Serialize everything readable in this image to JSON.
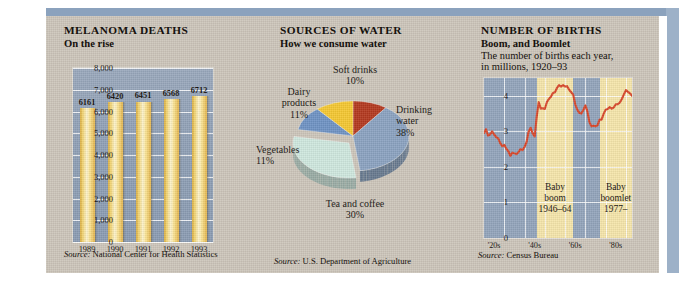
{
  "panels": [
    {
      "id": "melanoma",
      "title": "MELANOMA DEATHS",
      "subtitle": "On the rise",
      "source_prefix": "Source:",
      "source": "National Center for Health Statistics"
    },
    {
      "id": "water",
      "title": "SOURCES OF WATER",
      "subtitle": "How we consume water",
      "source_prefix": "Source:",
      "source": "U.S. Department of Agriculture"
    },
    {
      "id": "births",
      "title": "NUMBER OF BIRTHS",
      "subtitle": "Boom, and Boomlet",
      "desc_line1": "The number of births each year,",
      "desc_line2": "in millions, 1920–93",
      "source_prefix": "Source:",
      "source": "Census Bureau"
    }
  ],
  "chart_data": [
    {
      "type": "bar",
      "title": "MELANOMA DEATHS",
      "subtitle": "On the rise",
      "categories": [
        "1989",
        "1990",
        "1991",
        "1992",
        "1993"
      ],
      "values": [
        6161,
        6420,
        6451,
        6568,
        6712
      ],
      "data_labels": [
        "6161",
        "6420",
        "6451",
        "6568",
        "6712"
      ],
      "ylabel": "",
      "xlabel": "",
      "ylim": [
        0,
        8000
      ],
      "yticks": [
        0,
        1000,
        2000,
        3000,
        4000,
        5000,
        6000,
        7000,
        8000
      ],
      "ytick_labels": [
        "0",
        "1,000",
        "2,000",
        "3,000",
        "4,000",
        "5,000",
        "6,000",
        "7,000",
        "8,000"
      ],
      "grid": true,
      "legend": "none",
      "bar_color": "#f3d572",
      "plot_bg": "#93a4ba"
    },
    {
      "type": "pie",
      "title": "SOURCES OF WATER",
      "subtitle": "How we consume water",
      "labels": [
        "Drinking water",
        "Tea and coffee",
        "Vegetables",
        "Dairy products",
        "Soft drinks"
      ],
      "values": [
        38,
        30,
        11,
        11,
        10
      ],
      "label_texts": [
        {
          "name": "Drinking",
          "name2": "water",
          "pct": "38%"
        },
        {
          "name": "Tea and coffee",
          "pct": "30%"
        },
        {
          "name": "Vegetables",
          "pct": "11%"
        },
        {
          "name": "Dairy",
          "name2": "products",
          "pct": "11%"
        },
        {
          "name": "Soft drinks",
          "pct": "10%"
        }
      ],
      "colors": [
        "#8ba3c1",
        "#cfe8df",
        "#6f93c4",
        "#f5c832",
        "#b4391f"
      ],
      "legend": "labels-outside"
    },
    {
      "type": "line",
      "title": "NUMBER OF BIRTHS",
      "subtitle": "Boom, and Boomlet",
      "description": "The number of births each year, in millions, 1920–93",
      "xlabel": "",
      "ylabel": "",
      "ylim": [
        0,
        4.5
      ],
      "yticks": [
        0,
        1,
        2,
        3,
        4
      ],
      "ytick_labels": [
        "0",
        "1",
        "2",
        "3",
        "4"
      ],
      "xlim": [
        1920,
        1993
      ],
      "xtick_labels": [
        "'20s",
        "'40s",
        "'60s",
        "'80s"
      ],
      "xticks": [
        1925,
        1945,
        1965,
        1985
      ],
      "grid": true,
      "line_color": "#d9472a",
      "plot_bg": "#93a5bc",
      "band_color": "#f6e6ab",
      "annotations": [
        {
          "line1": "Baby",
          "line2": "boom",
          "line3": "1946–64",
          "start": 1946,
          "end": 1964
        },
        {
          "line1": "Baby",
          "line2": "boomlet",
          "line3": "1977–",
          "start": 1977,
          "end": 1993
        }
      ],
      "x": [
        1920,
        1921,
        1922,
        1923,
        1924,
        1925,
        1926,
        1927,
        1928,
        1929,
        1930,
        1931,
        1932,
        1933,
        1934,
        1935,
        1936,
        1937,
        1938,
        1939,
        1940,
        1941,
        1942,
        1943,
        1944,
        1945,
        1946,
        1947,
        1948,
        1949,
        1950,
        1951,
        1952,
        1953,
        1954,
        1955,
        1956,
        1957,
        1958,
        1959,
        1960,
        1961,
        1962,
        1963,
        1964,
        1965,
        1966,
        1967,
        1968,
        1969,
        1970,
        1971,
        1972,
        1973,
        1974,
        1975,
        1976,
        1977,
        1978,
        1979,
        1980,
        1981,
        1982,
        1983,
        1984,
        1985,
        1986,
        1987,
        1988,
        1989,
        1990,
        1991,
        1992,
        1993
      ],
      "values": [
        2.95,
        3.06,
        2.88,
        2.91,
        3.0,
        2.91,
        2.84,
        2.8,
        2.67,
        2.58,
        2.62,
        2.51,
        2.44,
        2.31,
        2.4,
        2.38,
        2.36,
        2.41,
        2.5,
        2.47,
        2.56,
        2.7,
        2.99,
        3.1,
        2.94,
        2.86,
        3.41,
        3.82,
        3.64,
        3.65,
        3.63,
        3.82,
        3.91,
        3.97,
        4.08,
        4.1,
        4.22,
        4.3,
        4.26,
        4.3,
        4.26,
        4.27,
        4.17,
        4.1,
        4.03,
        3.76,
        3.61,
        3.52,
        3.5,
        3.6,
        3.73,
        3.56,
        3.26,
        3.14,
        3.16,
        3.14,
        3.17,
        3.33,
        3.33,
        3.49,
        3.61,
        3.63,
        3.68,
        3.64,
        3.67,
        3.76,
        3.76,
        3.81,
        3.91,
        4.04,
        4.16,
        4.11,
        4.07,
        4.0
      ]
    }
  ]
}
